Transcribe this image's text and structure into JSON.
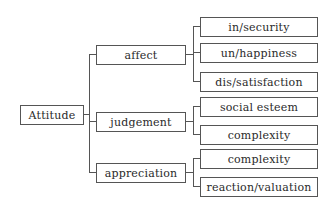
{
  "diagram": {
    "type": "tree",
    "root": {
      "label": "Attitude",
      "children": [
        {
          "label": "affect",
          "children": [
            {
              "label": "in/security"
            },
            {
              "label": "un/happiness"
            },
            {
              "label": "dis/satisfaction"
            }
          ]
        },
        {
          "label": "judgement",
          "children": [
            {
              "label": "social esteem"
            },
            {
              "label": "complexity"
            }
          ]
        },
        {
          "label": "appreciation",
          "children": [
            {
              "label": "complexity"
            },
            {
              "label": "reaction/valuation"
            }
          ]
        }
      ]
    },
    "colors": {
      "line": "#555555",
      "text": "#2a2a2a",
      "background": "#ffffff"
    }
  }
}
